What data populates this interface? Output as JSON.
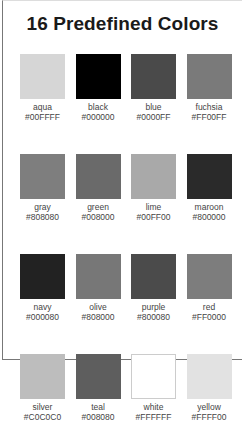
{
  "title": "16 Predefined Colors",
  "colors": [
    {
      "name": "aqua",
      "hex": "#00FFFF",
      "rendered": "#d6d6d6"
    },
    {
      "name": "black",
      "hex": "#000000",
      "rendered": "#000000"
    },
    {
      "name": "blue",
      "hex": "#0000FF",
      "rendered": "#4a4a4a"
    },
    {
      "name": "fuchsia",
      "hex": "#FF00FF",
      "rendered": "#7a7a7a"
    },
    {
      "name": "gray",
      "hex": "#808080",
      "rendered": "#7e7e7e"
    },
    {
      "name": "green",
      "hex": "#008000",
      "rendered": "#6a6a6a"
    },
    {
      "name": "lime",
      "hex": "#00FF00",
      "rendered": "#a9a9a9"
    },
    {
      "name": "maroon",
      "hex": "#800000",
      "rendered": "#2a2a2a"
    },
    {
      "name": "navy",
      "hex": "#000080",
      "rendered": "#222222"
    },
    {
      "name": "olive",
      "hex": "#808000",
      "rendered": "#777777"
    },
    {
      "name": "purple",
      "hex": "#800080",
      "rendered": "#4b4b4b"
    },
    {
      "name": "red",
      "hex": "#FF0000",
      "rendered": "#7d7d7d"
    },
    {
      "name": "silver",
      "hex": "#C0C0C0",
      "rendered": "#bdbdbd"
    },
    {
      "name": "teal",
      "hex": "#008080",
      "rendered": "#5e5e5e"
    },
    {
      "name": "white",
      "hex": "#FFFFFF",
      "rendered": "#ffffff"
    },
    {
      "name": "yellow",
      "hex": "#FFFF00",
      "rendered": "#e2e2e2"
    }
  ]
}
